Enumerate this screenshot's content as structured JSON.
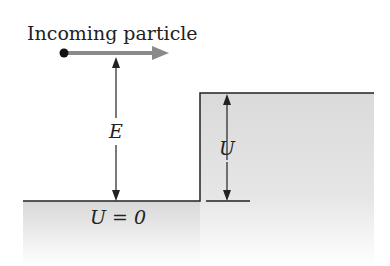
{
  "diagram": {
    "title_label": "Incoming particle",
    "energy_label": "E",
    "barrier_label": "U",
    "ground_label": "U = 0",
    "colors": {
      "line": "#222222",
      "arrow_gray": "#8a8a8a",
      "shade_top": "#dcdcdc",
      "shade_bottom": "#ffffff"
    }
  }
}
